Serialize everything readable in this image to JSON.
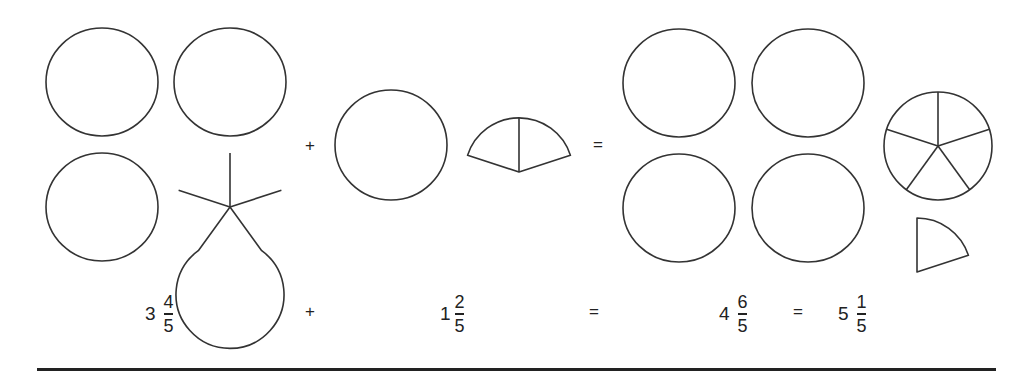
{
  "diagram": {
    "stroke_color": "#333333",
    "background": "#ffffff",
    "radius": 55,
    "slices_per_whole": 5,
    "left_group": {
      "wholes": 3,
      "partial_fifths": 4,
      "circles": [
        {
          "cx": 102,
          "cy": 82
        },
        {
          "cx": 230,
          "cy": 82
        },
        {
          "cx": 102,
          "cy": 207
        }
      ],
      "partial": {
        "cx": 230,
        "cy": 207,
        "fifths": 4
      }
    },
    "plus_sign": {
      "text": "+",
      "x": 305,
      "y": 136
    },
    "middle_group": {
      "wholes": 1,
      "partial_fifths": 2,
      "circles": [
        {
          "cx": 391,
          "cy": 145
        }
      ],
      "partial": {
        "cx": 519,
        "cy": 172,
        "fifths": 2
      }
    },
    "equals_sign": {
      "text": "=",
      "x": 593,
      "y": 136
    },
    "right_group": {
      "wholes": 4,
      "extra_fifths": 6,
      "circles": [
        {
          "cx": 679,
          "cy": 83
        },
        {
          "cx": 808,
          "cy": 83
        },
        {
          "cx": 679,
          "cy": 208
        },
        {
          "cx": 808,
          "cy": 208
        }
      ],
      "sliced_circle": {
        "cx": 938,
        "cy": 146,
        "fifths": 5
      },
      "single_wedge": {
        "cx": 917,
        "cy": 272,
        "fifths": 1
      }
    }
  },
  "equation": {
    "term1": {
      "whole": "3",
      "numerator": "4",
      "denominator": "5"
    },
    "op1": "+",
    "term2": {
      "whole": "1",
      "numerator": "2",
      "denominator": "5"
    },
    "op2": "=",
    "result": {
      "whole": "4",
      "numerator": "6",
      "denominator": "5"
    },
    "op3": "=",
    "simplified": {
      "whole": "5",
      "numerator": "1",
      "denominator": "5"
    }
  }
}
